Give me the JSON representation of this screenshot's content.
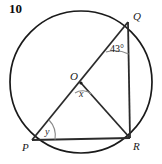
{
  "question": {
    "number": "10"
  },
  "figure": {
    "type": "circle-geometry-diagram",
    "circle": {
      "center_label": "O",
      "cx": 81,
      "cy": 82,
      "r": 71
    },
    "points": [
      {
        "label": "Q",
        "x": 128,
        "y": 22
      },
      {
        "label": "R",
        "x": 130,
        "y": 138
      },
      {
        "label": "P",
        "x": 32,
        "y": 140
      },
      {
        "label": "O",
        "x": 81,
        "y": 83
      }
    ],
    "segments": [
      {
        "name": "PQ-diameter",
        "from": "P",
        "to": "Q"
      },
      {
        "name": "OR-radius",
        "from": "O",
        "to": "R"
      },
      {
        "name": "QR-chord",
        "from": "Q",
        "to": "R"
      },
      {
        "name": "PR-chord",
        "from": "P",
        "to": "R"
      }
    ],
    "angles": [
      {
        "name": "angle-at-Q",
        "label": "43°",
        "vertex": "Q",
        "value": 43
      },
      {
        "name": "angle-at-O",
        "label": "x",
        "vertex": "O"
      },
      {
        "name": "angle-at-P",
        "label": "y",
        "vertex": "P"
      }
    ],
    "colors": {
      "stroke": "#2b2b2b",
      "circle_stroke": "#1a1a1a",
      "arc_stroke": "#808080",
      "text": "#111111",
      "background": "#ffffff"
    }
  }
}
